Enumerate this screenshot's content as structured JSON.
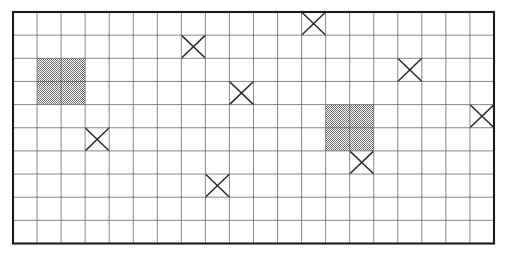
{
  "figure": {
    "name": "grid-diagram",
    "background_color": "#ffffff",
    "border_color": "#1a1a1a",
    "grid_line_color": "#555555",
    "shade_color": "#9a9a9a",
    "mark_color": "#2a2a2a"
  },
  "grid": {
    "columns": 20,
    "rows": 10,
    "origin_x": 13,
    "origin_y": 12,
    "cell_width": 24.05,
    "cell_height": 23.15,
    "border_width": 2.1,
    "line_width": 0.7
  },
  "chart_data": {
    "type": "heatmap",
    "title": "",
    "xlabel": "",
    "ylabel": "",
    "grid": true,
    "legend": "none",
    "columns": 20,
    "rows": 10,
    "x": [
      0,
      1,
      2,
      3,
      4,
      5,
      6,
      7,
      8,
      9,
      10,
      11,
      12,
      13,
      14,
      15,
      16,
      17,
      18,
      19
    ],
    "y": [
      0,
      1,
      2,
      3,
      4,
      5,
      6,
      7,
      8,
      9
    ],
    "cell_states": [
      "empty",
      "shaded",
      "x-mark"
    ],
    "shaded_cells": [
      {
        "col": 1,
        "row": 2
      },
      {
        "col": 2,
        "row": 2
      },
      {
        "col": 1,
        "row": 3
      },
      {
        "col": 2,
        "row": 3
      },
      {
        "col": 13,
        "row": 4
      },
      {
        "col": 14,
        "row": 4
      },
      {
        "col": 13,
        "row": 5
      },
      {
        "col": 14,
        "row": 5
      }
    ],
    "shaded_blocks": [
      {
        "col_start": 1,
        "col_end": 2,
        "row_start": 2,
        "row_end": 3,
        "width_cells": 2,
        "height_cells": 2
      },
      {
        "col_start": 13,
        "col_end": 14,
        "row_start": 4,
        "row_end": 5,
        "width_cells": 2,
        "height_cells": 2
      }
    ],
    "x_marked_cells": [
      {
        "col": 12,
        "row": 0
      },
      {
        "col": 7,
        "row": 1
      },
      {
        "col": 16,
        "row": 2
      },
      {
        "col": 9,
        "row": 3
      },
      {
        "col": 19,
        "row": 4
      },
      {
        "col": 3,
        "row": 5
      },
      {
        "col": 14,
        "row": 6
      },
      {
        "col": 8,
        "row": 7
      }
    ],
    "counts": {
      "total_cells": 200,
      "shaded_cells": 8,
      "x_marked_cells": 8,
      "empty_cells": 184
    }
  }
}
